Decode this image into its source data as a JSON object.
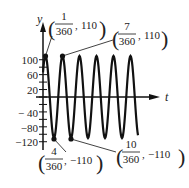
{
  "chart_data": {
    "type": "line",
    "title": "",
    "xlabel": "t",
    "ylabel": "y",
    "function": "y = 110 sin(...)  period 3/360",
    "amplitude": 110,
    "ylim": [
      -120,
      110
    ],
    "yticks_labeled": [
      100,
      60,
      20,
      -40,
      -80,
      -120
    ],
    "ytick_step": 20,
    "grid": false,
    "annotations": [
      {
        "num": "1",
        "den": "360",
        "y": "110",
        "label": "(1/360, 110)",
        "type": "max"
      },
      {
        "num": "7",
        "den": "360",
        "y": "110",
        "label": "(7/360, 110)",
        "type": "max"
      },
      {
        "num": "4",
        "den": "360",
        "y": "−110",
        "label": "(4/360, −110)",
        "type": "min"
      },
      {
        "num": "10",
        "den": "360",
        "y": "−110",
        "label": "(10/360, −110)",
        "type": "min"
      }
    ],
    "points": [
      {
        "t": 0.0027778,
        "y": 110
      },
      {
        "t": 0.0194444,
        "y": 110
      },
      {
        "t": 0.0111111,
        "y": -110
      },
      {
        "t": 0.0277778,
        "y": -110
      }
    ]
  },
  "axis": {
    "x_label": "t",
    "y_label": "y",
    "ytick_labels": [
      "100",
      "60",
      "20",
      "− 40",
      "−80",
      "−120"
    ]
  }
}
